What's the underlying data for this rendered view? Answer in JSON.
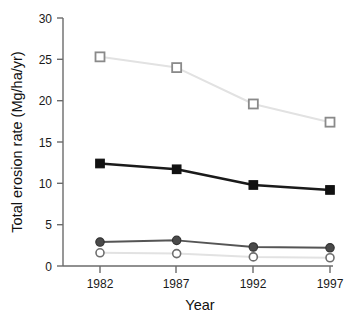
{
  "chart_data": {
    "type": "line",
    "title": "",
    "xlabel": "Year",
    "ylabel": "Total erosion rate (Mg/ha/yr)",
    "categories": [
      "1982",
      "1987",
      "1992",
      "1997"
    ],
    "x": [
      1982,
      1987,
      1992,
      1997
    ],
    "xlim": [
      1980.2,
      1998.5
    ],
    "ylim": [
      0,
      30
    ],
    "yticks": [
      0,
      5,
      10,
      15,
      20,
      25,
      30
    ],
    "ytick_labels": [
      "0",
      "5",
      "10",
      "15",
      "20",
      "25",
      "30"
    ],
    "xticks": [
      1982,
      1987,
      1992,
      1997
    ],
    "xtick_labels": [
      "1982",
      "1987",
      "1992",
      "1997"
    ],
    "grid": false,
    "legend": "none",
    "series": [
      {
        "name": "open-square-series",
        "marker": "open-square",
        "line_color": "#e2e2e2",
        "marker_edge_color": "#8a8a8a",
        "marker_face_color": "#ffffff",
        "values": [
          25.3,
          24.0,
          19.6,
          17.4
        ]
      },
      {
        "name": "filled-square-series",
        "marker": "filled-square",
        "line_color": "#1a1a1a",
        "marker_edge_color": "#111111",
        "marker_face_color": "#111111",
        "values": [
          12.4,
          11.7,
          9.8,
          9.2
        ]
      },
      {
        "name": "filled-circle-series",
        "marker": "filled-circle",
        "line_color": "#555555",
        "marker_edge_color": "#333333",
        "marker_face_color": "#4a4a4a",
        "values": [
          2.9,
          3.1,
          2.3,
          2.2
        ]
      },
      {
        "name": "open-circle-series",
        "marker": "open-circle",
        "line_color": "#e2e2e2",
        "marker_edge_color": "#6e6e6e",
        "marker_face_color": "#ffffff",
        "values": [
          1.6,
          1.5,
          1.1,
          1.0
        ]
      }
    ],
    "axis_color": "#6b6b6b",
    "background": "#ffffff"
  }
}
